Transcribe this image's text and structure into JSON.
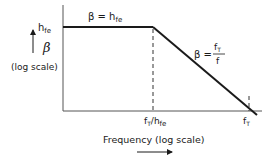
{
  "diagram": {
    "y_axis": {
      "symbol": "β",
      "scale_label": "(log scale)",
      "tick_label_main": "h",
      "tick_label_sub": "fe"
    },
    "x_axis": {
      "label": "Frequency (log scale)",
      "tick1_main": "f",
      "tick1_sub": "T",
      "tick1_sep": "/h",
      "tick1_sub2": "fe",
      "tick2_main": "f",
      "tick2_sub": "T"
    },
    "annotations": {
      "flat_region_prefix": "β = h",
      "flat_region_sub": "fe",
      "rolloff_prefix": "β =",
      "rolloff_num_main": "f",
      "rolloff_num_sub": "T",
      "rolloff_den": "f"
    },
    "colors": {
      "line": "#1a1a1a",
      "axis": "#555555",
      "background": "#ffffff"
    }
  }
}
